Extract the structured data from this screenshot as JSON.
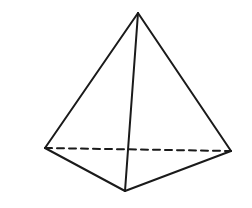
{
  "diagram": {
    "type": "tetrahedron",
    "stroke_color": "#1a1a1a",
    "background": "#ffffff",
    "vertices": {
      "apex": [
        138,
        13
      ],
      "left": [
        45,
        148
      ],
      "right": [
        231,
        151
      ],
      "front": [
        125,
        191
      ]
    },
    "edges": [
      {
        "from": "apex",
        "to": "left",
        "style": "solid"
      },
      {
        "from": "apex",
        "to": "right",
        "style": "solid"
      },
      {
        "from": "apex",
        "to": "front",
        "style": "solid"
      },
      {
        "from": "left",
        "to": "front",
        "style": "solid"
      },
      {
        "from": "right",
        "to": "front",
        "style": "solid"
      },
      {
        "from": "left",
        "to": "right",
        "style": "dashed"
      }
    ]
  }
}
